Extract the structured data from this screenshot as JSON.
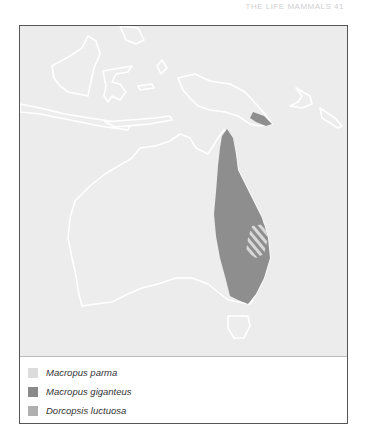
{
  "header": {
    "running_head": "THE LIFE MAMMALS 41"
  },
  "map": {
    "background_color": "#ececec",
    "land_color": "#ededed",
    "coast_color": "#ffffff",
    "regions": [
      {
        "species": "Macropus giganteus",
        "area": "eastern Australia and southeastern New Guinea",
        "color": "#8e8e8e"
      },
      {
        "species": "Macropus parma",
        "area": "hatched patch, coastal New South Wales",
        "color": "#d8d8d8"
      }
    ]
  },
  "legend": {
    "items": [
      {
        "label": "Macropus parma",
        "color": "#dcdcdc"
      },
      {
        "label": "Macropus giganteus",
        "color": "#8a8a8a"
      },
      {
        "label": "Dorcopsis luctuosa",
        "color": "#b0b0b0"
      }
    ]
  }
}
